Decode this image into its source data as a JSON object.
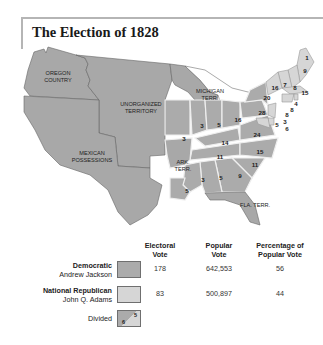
{
  "title": "The Election of 1828",
  "colors": {
    "democratic": "#ababab",
    "national_republican": "#d6d6d6",
    "territory": "#a6a6a6",
    "frame": "#b5b5b5"
  },
  "map": {
    "region_labels": {
      "oregon": [
        "OREGON",
        "COUNTRY"
      ],
      "unorganized": [
        "UNORGANIZED",
        "TERRITORY"
      ],
      "mexican": [
        "MEXICAN",
        "POSSESSIONS"
      ],
      "michigan": [
        "MICHIGAN",
        "TERR."
      ],
      "arkansas": [
        "ARK.",
        "TERR."
      ],
      "florida": "FLA. TERR."
    },
    "electoral_votes": {
      "maine": "9",
      "maine_divided": "1",
      "new_hampshire": "8",
      "vermont": "7",
      "new_york_upper": "16",
      "massachusetts": "15",
      "connecticut": "8",
      "rhode_island": "4",
      "new_york": "20",
      "new_jersey": "8",
      "pennsylvania": "28",
      "delaware": "3",
      "maryland_a": "5",
      "maryland_b": "6",
      "ohio": "16",
      "indiana": "5",
      "illinois": "3",
      "missouri": "3",
      "kentucky": "14",
      "virginia": "24",
      "tennessee": "11",
      "north_carolina": "15",
      "south_carolina": "11",
      "georgia": "9",
      "alabama": "5",
      "mississippi": "3",
      "louisiana": "5"
    }
  },
  "legend": {
    "headers": {
      "electoral": [
        "Electoral",
        "Vote"
      ],
      "popular": [
        "Popular",
        "Vote"
      ],
      "percentage": [
        "Percentage of",
        "Popular Vote"
      ]
    },
    "rows": [
      {
        "party": "Democratic",
        "candidate": "Andrew Jackson",
        "electoral_vote": "178",
        "popular_vote": "642,553",
        "percentage": "56"
      },
      {
        "party": "National Republican",
        "candidate": "John Q. Adams",
        "electoral_vote": "83",
        "popular_vote": "500,897",
        "percentage": "44"
      },
      {
        "party": "Divided",
        "divided_sample": [
          "6",
          "5"
        ]
      }
    ]
  }
}
